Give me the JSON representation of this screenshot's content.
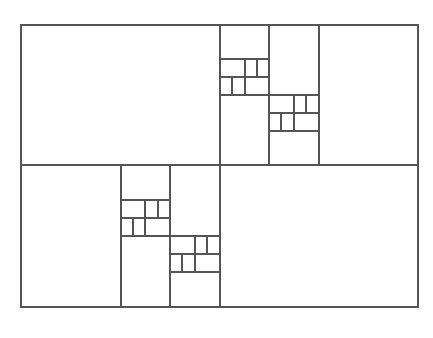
{
  "diagram": {
    "title": "",
    "stroke_color": "#555555",
    "background": "#ffffff",
    "outer_rect": {
      "x": 21,
      "y": 25,
      "w": 397,
      "h": 282
    },
    "lines": [
      {
        "id": "mid-vertical",
        "x1": 220,
        "y1": 25,
        "x2": 220,
        "y2": 307
      },
      {
        "id": "mid-horizontal",
        "x1": 21,
        "y1": 165,
        "x2": 418,
        "y2": 165
      },
      {
        "id": "ur-col-1",
        "x1": 269,
        "y1": 25,
        "x2": 269,
        "y2": 165
      },
      {
        "id": "ur-col-2",
        "x1": 319,
        "y1": 25,
        "x2": 319,
        "y2": 165
      },
      {
        "id": "ur-g1-h1",
        "x1": 220,
        "y1": 59,
        "x2": 269,
        "y2": 59
      },
      {
        "id": "ur-g1-h2",
        "x1": 220,
        "y1": 77,
        "x2": 269,
        "y2": 77
      },
      {
        "id": "ur-g1-h3",
        "x1": 220,
        "y1": 95,
        "x2": 269,
        "y2": 95
      },
      {
        "id": "ur-g1-r1-v1",
        "x1": 245,
        "y1": 59,
        "x2": 245,
        "y2": 77
      },
      {
        "id": "ur-g1-r1-v2",
        "x1": 257,
        "y1": 59,
        "x2": 257,
        "y2": 77
      },
      {
        "id": "ur-g1-r2-v1",
        "x1": 232,
        "y1": 77,
        "x2": 232,
        "y2": 95
      },
      {
        "id": "ur-g1-r2-v2",
        "x1": 245,
        "y1": 77,
        "x2": 245,
        "y2": 95
      },
      {
        "id": "ur-g2-h1",
        "x1": 269,
        "y1": 95,
        "x2": 319,
        "y2": 95
      },
      {
        "id": "ur-g2-h2",
        "x1": 269,
        "y1": 113,
        "x2": 319,
        "y2": 113
      },
      {
        "id": "ur-g2-h3",
        "x1": 269,
        "y1": 131,
        "x2": 319,
        "y2": 131
      },
      {
        "id": "ur-g2-r1-v1",
        "x1": 294,
        "y1": 95,
        "x2": 294,
        "y2": 113
      },
      {
        "id": "ur-g2-r1-v2",
        "x1": 306,
        "y1": 95,
        "x2": 306,
        "y2": 113
      },
      {
        "id": "ur-g2-r2-v1",
        "x1": 281,
        "y1": 113,
        "x2": 281,
        "y2": 131
      },
      {
        "id": "ur-g2-r2-v2",
        "x1": 294,
        "y1": 113,
        "x2": 294,
        "y2": 131
      },
      {
        "id": "ll-col-1",
        "x1": 121,
        "y1": 165,
        "x2": 121,
        "y2": 307
      },
      {
        "id": "ll-col-2",
        "x1": 170,
        "y1": 165,
        "x2": 170,
        "y2": 307
      },
      {
        "id": "ll-g1-h1",
        "x1": 121,
        "y1": 200,
        "x2": 170,
        "y2": 200
      },
      {
        "id": "ll-g1-h2",
        "x1": 121,
        "y1": 218,
        "x2": 170,
        "y2": 218
      },
      {
        "id": "ll-g1-h3",
        "x1": 121,
        "y1": 236,
        "x2": 170,
        "y2": 236
      },
      {
        "id": "ll-g1-r1-v1",
        "x1": 145,
        "y1": 200,
        "x2": 145,
        "y2": 218
      },
      {
        "id": "ll-g1-r1-v2",
        "x1": 158,
        "y1": 200,
        "x2": 158,
        "y2": 218
      },
      {
        "id": "ll-g1-r2-v1",
        "x1": 133,
        "y1": 218,
        "x2": 133,
        "y2": 236
      },
      {
        "id": "ll-g1-r2-v2",
        "x1": 145,
        "y1": 218,
        "x2": 145,
        "y2": 236
      },
      {
        "id": "ll-g2-h1",
        "x1": 170,
        "y1": 236,
        "x2": 220,
        "y2": 236
      },
      {
        "id": "ll-g2-h2",
        "x1": 170,
        "y1": 254,
        "x2": 220,
        "y2": 254
      },
      {
        "id": "ll-g2-h3",
        "x1": 170,
        "y1": 272,
        "x2": 220,
        "y2": 272
      },
      {
        "id": "ll-g2-r1-v1",
        "x1": 195,
        "y1": 236,
        "x2": 195,
        "y2": 254
      },
      {
        "id": "ll-g2-r1-v2",
        "x1": 207,
        "y1": 236,
        "x2": 207,
        "y2": 254
      },
      {
        "id": "ll-g2-r2-v1",
        "x1": 182,
        "y1": 254,
        "x2": 182,
        "y2": 272
      },
      {
        "id": "ll-g2-r2-v2",
        "x1": 195,
        "y1": 254,
        "x2": 195,
        "y2": 272
      }
    ]
  }
}
